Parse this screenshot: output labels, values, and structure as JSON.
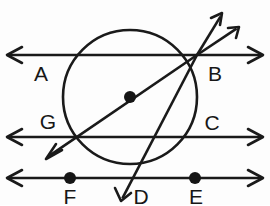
{
  "figure": {
    "width": 270,
    "height": 205,
    "background_color": "#fdfdfd",
    "ink_color": "#1a1a1a",
    "label_color": "#171717"
  },
  "circle": {
    "name": "main-circle",
    "center_x": 130,
    "center_y": 97,
    "radius": 67,
    "stroke_width": 2.6
  },
  "lines": [
    {
      "id": "line-top",
      "label_left": "A",
      "label_right": "B",
      "y": 55,
      "x_start": 8,
      "x_end": 262,
      "arrow_left": true,
      "arrow_right": true
    },
    {
      "id": "line-middle",
      "label_left": "G",
      "label_right": "C",
      "y": 137,
      "x_start": 8,
      "x_end": 262,
      "arrow_left": true,
      "arrow_right": true
    },
    {
      "id": "line-bottom",
      "label_left": "F",
      "label_right": "E",
      "y": 178,
      "x_start": 8,
      "x_end": 262,
      "arrow_left": true,
      "arrow_right": true
    }
  ],
  "rays": [
    {
      "id": "ray-b-upper-steep",
      "from": "B",
      "x1": 197,
      "y1": 55,
      "x2": 222,
      "y2": 14,
      "arrow_at_end": true
    },
    {
      "id": "ray-b-upper-shallow",
      "from": "B",
      "x1": 197,
      "y1": 55,
      "x2": 239,
      "y2": 27,
      "arrow_at_end": true
    },
    {
      "id": "ray-b-diameter",
      "from": "B",
      "through": "center",
      "x1": 197,
      "y1": 55,
      "x2": 46,
      "y2": 158,
      "arrow_at_end": true
    },
    {
      "id": "ray-b-chord-to-d",
      "from": "B",
      "x1": 197,
      "y1": 55,
      "x2": 121,
      "y2": 201,
      "arrow_at_end": true
    }
  ],
  "points": [
    {
      "id": "point-center",
      "label": "",
      "x": 130,
      "y": 97,
      "dot": true,
      "dot_radius": 6
    },
    {
      "id": "point-b",
      "label": "B",
      "x": 197,
      "y": 55,
      "dot": false
    },
    {
      "id": "point-f",
      "label": "F",
      "x": 70,
      "y": 178,
      "dot": true,
      "dot_radius": 6
    },
    {
      "id": "point-e",
      "label": "E",
      "x": 195,
      "y": 178,
      "dot": true,
      "dot_radius": 6
    }
  ],
  "labels": [
    {
      "id": "label-a",
      "text": "A",
      "x": 41,
      "y": 73
    },
    {
      "id": "label-b",
      "text": "B",
      "x": 215,
      "y": 73
    },
    {
      "id": "label-g",
      "text": "G",
      "x": 48,
      "y": 121
    },
    {
      "id": "label-c",
      "text": "C",
      "x": 212,
      "y": 122
    },
    {
      "id": "label-f",
      "text": "F",
      "x": 70,
      "y": 196
    },
    {
      "id": "label-d",
      "text": "D",
      "x": 141,
      "y": 196
    },
    {
      "id": "label-e",
      "text": "E",
      "x": 196,
      "y": 196
    }
  ]
}
